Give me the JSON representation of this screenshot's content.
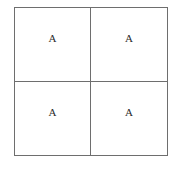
{
  "diagram": {
    "type": "punnett-square",
    "title": "",
    "rows": 2,
    "columns": 2,
    "border_color": "#6e6e6e",
    "background_color": "#ffffff",
    "text_color": "#2b2b2b",
    "cells": [
      {
        "id": "cell-0-0",
        "row": 0,
        "col": 0,
        "label": "A"
      },
      {
        "id": "cell-0-1",
        "row": 0,
        "col": 1,
        "label": "A"
      },
      {
        "id": "cell-1-0",
        "row": 1,
        "col": 0,
        "label": "A"
      },
      {
        "id": "cell-1-1",
        "row": 1,
        "col": 1,
        "label": "A"
      }
    ]
  }
}
